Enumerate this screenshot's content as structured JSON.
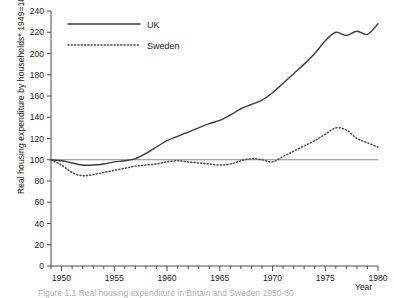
{
  "chart_data": {
    "type": "line",
    "title": "",
    "caption": "Figure 1.1  Real housing expenditure in Britain and Sweden 1950-80",
    "xlabel": "Year",
    "ylabel": "Real housing expenditure by households*  1949=100",
    "xlim": [
      1949,
      1980
    ],
    "ylim": [
      0,
      240
    ],
    "ytick_step": 20,
    "xtick_major_step": 5,
    "xtick_minor_step": 1,
    "grid": false,
    "legend_position": "top-left",
    "reference_line": 100,
    "yticks": [
      "0",
      "20",
      "40",
      "60",
      "80",
      "100",
      "120",
      "140",
      "160",
      "180",
      "200",
      "220",
      "240"
    ],
    "xticks": [
      "1950",
      "1955",
      "1960",
      "1965",
      "1970",
      "1975",
      "1980"
    ],
    "x": [
      1949,
      1950,
      1951,
      1952,
      1953,
      1954,
      1955,
      1956,
      1957,
      1958,
      1959,
      1960,
      1961,
      1962,
      1963,
      1964,
      1965,
      1966,
      1967,
      1968,
      1969,
      1970,
      1971,
      1972,
      1973,
      1974,
      1975,
      1976,
      1977,
      1978,
      1979,
      1980
    ],
    "series": [
      {
        "name": "UK",
        "style": "solid",
        "color": "#3a3a3a",
        "values": [
          100,
          99,
          97,
          95,
          95,
          96,
          98,
          99,
          101,
          106,
          112,
          118,
          122,
          126,
          130,
          134,
          137,
          142,
          148,
          152,
          156,
          163,
          172,
          181,
          190,
          200,
          212,
          220,
          217,
          221,
          218,
          228
        ]
      },
      {
        "name": "Sweden",
        "style": "dotted",
        "color": "#4a4a4a",
        "values": [
          100,
          95,
          88,
          85,
          86,
          88,
          90,
          92,
          94,
          95,
          96,
          98,
          99,
          98,
          97,
          96,
          95,
          96,
          99,
          101,
          100,
          98,
          103,
          108,
          113,
          118,
          124,
          130,
          128,
          120,
          116,
          112
        ]
      }
    ],
    "legend": [
      {
        "label": "UK",
        "style": "solid"
      },
      {
        "label": "Sweden",
        "style": "dotted"
      }
    ]
  },
  "axis": {
    "x_axis_name": "Year"
  }
}
